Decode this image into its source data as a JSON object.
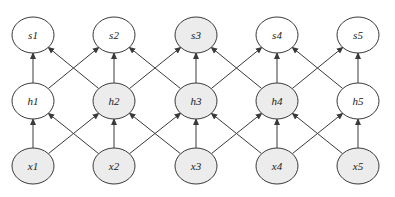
{
  "diagram": {
    "colors": {
      "stroke": "#3a3a3a",
      "shaded_fill": "#ececec",
      "unshaded_fill": "#ffffff",
      "edge": "#3a3a3a"
    },
    "rows": {
      "s": {
        "y": 35
      },
      "h": {
        "y": 101
      },
      "x": {
        "y": 166
      }
    },
    "columns": [
      33,
      114,
      196,
      277,
      358
    ],
    "nodes": [
      {
        "id": "s1",
        "label": "s1",
        "row": "s",
        "col": 0,
        "shaded": false
      },
      {
        "id": "s2",
        "label": "s2",
        "row": "s",
        "col": 1,
        "shaded": false
      },
      {
        "id": "s3",
        "label": "s3",
        "row": "s",
        "col": 2,
        "shaded": true
      },
      {
        "id": "s4",
        "label": "s4",
        "row": "s",
        "col": 3,
        "shaded": false
      },
      {
        "id": "s5",
        "label": "s5",
        "row": "s",
        "col": 4,
        "shaded": false
      },
      {
        "id": "h1",
        "label": "h1",
        "row": "h",
        "col": 0,
        "shaded": false
      },
      {
        "id": "h2",
        "label": "h2",
        "row": "h",
        "col": 1,
        "shaded": true
      },
      {
        "id": "h3",
        "label": "h3",
        "row": "h",
        "col": 2,
        "shaded": true
      },
      {
        "id": "h4",
        "label": "h4",
        "row": "h",
        "col": 3,
        "shaded": true
      },
      {
        "id": "h5",
        "label": "h5",
        "row": "h",
        "col": 4,
        "shaded": false
      },
      {
        "id": "x1",
        "label": "x1",
        "row": "x",
        "col": 0,
        "shaded": true
      },
      {
        "id": "x2",
        "label": "x2",
        "row": "x",
        "col": 1,
        "shaded": true
      },
      {
        "id": "x3",
        "label": "x3",
        "row": "x",
        "col": 2,
        "shaded": true
      },
      {
        "id": "x4",
        "label": "x4",
        "row": "x",
        "col": 3,
        "shaded": true
      },
      {
        "id": "x5",
        "label": "x5",
        "row": "x",
        "col": 4,
        "shaded": true
      }
    ],
    "edges": [
      [
        "x1",
        "h1"
      ],
      [
        "x1",
        "h2"
      ],
      [
        "x2",
        "h1"
      ],
      [
        "x2",
        "h2"
      ],
      [
        "x2",
        "h3"
      ],
      [
        "x3",
        "h2"
      ],
      [
        "x3",
        "h3"
      ],
      [
        "x3",
        "h4"
      ],
      [
        "x4",
        "h3"
      ],
      [
        "x4",
        "h4"
      ],
      [
        "x4",
        "h5"
      ],
      [
        "x5",
        "h4"
      ],
      [
        "x5",
        "h5"
      ],
      [
        "h1",
        "s1"
      ],
      [
        "h1",
        "s2"
      ],
      [
        "h2",
        "s1"
      ],
      [
        "h2",
        "s2"
      ],
      [
        "h2",
        "s3"
      ],
      [
        "h3",
        "s2"
      ],
      [
        "h3",
        "s3"
      ],
      [
        "h3",
        "s4"
      ],
      [
        "h4",
        "s3"
      ],
      [
        "h4",
        "s4"
      ],
      [
        "h4",
        "s5"
      ],
      [
        "h5",
        "s4"
      ],
      [
        "h5",
        "s5"
      ]
    ],
    "node_rx": 21,
    "node_ry": 18
  }
}
